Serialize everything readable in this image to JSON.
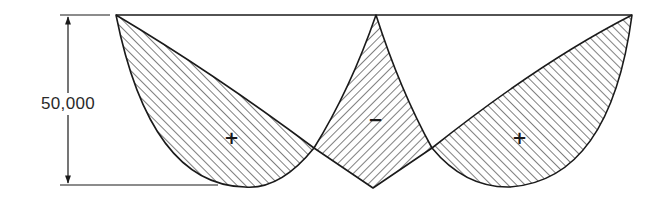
{
  "diagram": {
    "type": "moment-diagram",
    "dimension": {
      "label": "50,000",
      "orientation": "vertical"
    },
    "regions": [
      {
        "id": "left",
        "sign": "+",
        "hatch": "forward-slash"
      },
      {
        "id": "middle",
        "sign": "−",
        "hatch": "back-slash"
      },
      {
        "id": "right",
        "sign": "+",
        "hatch": "forward-slash"
      }
    ],
    "colors": {
      "line": "#1a1a1a",
      "hatch": "#3a3a3a",
      "background": "#ffffff"
    }
  }
}
